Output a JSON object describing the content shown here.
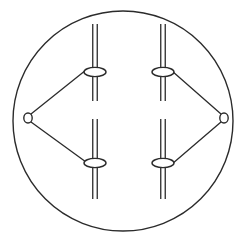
{
  "figure": {
    "background_color": "#ffffff",
    "stroke_color": "#2b2b2b",
    "fill_color": "#ffffff",
    "width": 246,
    "height": 244
  },
  "housing": {
    "name": "outer-circle",
    "shape": "ellipse",
    "cx": 123,
    "cy": 121,
    "rx": 110,
    "ry": 110,
    "stroke_width": 1.4
  },
  "rails": [
    {
      "id": "rail-top-left",
      "label": "top-left vertical rail",
      "x": 95,
      "y_top": 24,
      "y_bottom": 101,
      "gap": 4.5,
      "stroke_width": 1.3
    },
    {
      "id": "rail-top-right",
      "label": "top-right vertical rail",
      "x": 163,
      "y_top": 24,
      "y_bottom": 101,
      "gap": 4.5,
      "stroke_width": 1.3
    },
    {
      "id": "rail-bottom-left",
      "label": "bottom-left vertical rail",
      "x": 95,
      "y_top": 119,
      "y_bottom": 199,
      "gap": 4.5,
      "stroke_width": 1.3
    },
    {
      "id": "rail-bottom-right",
      "label": "bottom-right vertical rail",
      "x": 163,
      "y_top": 119,
      "y_bottom": 199,
      "gap": 4.5,
      "stroke_width": 1.3
    }
  ],
  "sliders": [
    {
      "id": "slider-top-left",
      "label": "top-left slider bead",
      "cx": 95,
      "cy": 72,
      "rx": 11,
      "ry": 4.6,
      "stroke_width": 1.4
    },
    {
      "id": "slider-top-right",
      "label": "top-right slider bead",
      "cx": 163,
      "cy": 72,
      "rx": 11,
      "ry": 4.6,
      "stroke_width": 1.4
    },
    {
      "id": "slider-bottom-left",
      "label": "bottom-left slider bead",
      "cx": 95,
      "cy": 163,
      "rx": 11,
      "ry": 4.6,
      "stroke_width": 1.4
    },
    {
      "id": "slider-bottom-right",
      "label": "bottom-right slider bead",
      "cx": 163,
      "cy": 163,
      "rx": 11,
      "ry": 4.6,
      "stroke_width": 1.4
    }
  ],
  "pivots": [
    {
      "id": "pivot-left",
      "label": "left pin joint",
      "cx": 28,
      "cy": 118,
      "rx": 4.2,
      "ry": 5.0,
      "stroke_width": 1.4
    },
    {
      "id": "pivot-right",
      "label": "right pin joint",
      "cx": 224,
      "cy": 118,
      "rx": 4.2,
      "ry": 5.0,
      "stroke_width": 1.4
    }
  ],
  "links": [
    {
      "id": "link-left-upper",
      "label": "left pivot to top-left slider",
      "x1": 31,
      "y1": 114,
      "x2": 86,
      "y2": 70,
      "stroke_width": 1.3
    },
    {
      "id": "link-left-lower",
      "label": "left pivot to bottom-left slider",
      "x1": 31,
      "y1": 122,
      "x2": 86,
      "y2": 162,
      "stroke_width": 1.3
    },
    {
      "id": "link-right-upper",
      "label": "right pivot to top-right slider",
      "x1": 221,
      "y1": 114,
      "x2": 172,
      "y2": 71,
      "stroke_width": 1.3
    },
    {
      "id": "link-right-lower",
      "label": "right pivot to bottom-right slider",
      "x1": 221,
      "y1": 122,
      "x2": 172,
      "y2": 164,
      "stroke_width": 1.3
    }
  ]
}
